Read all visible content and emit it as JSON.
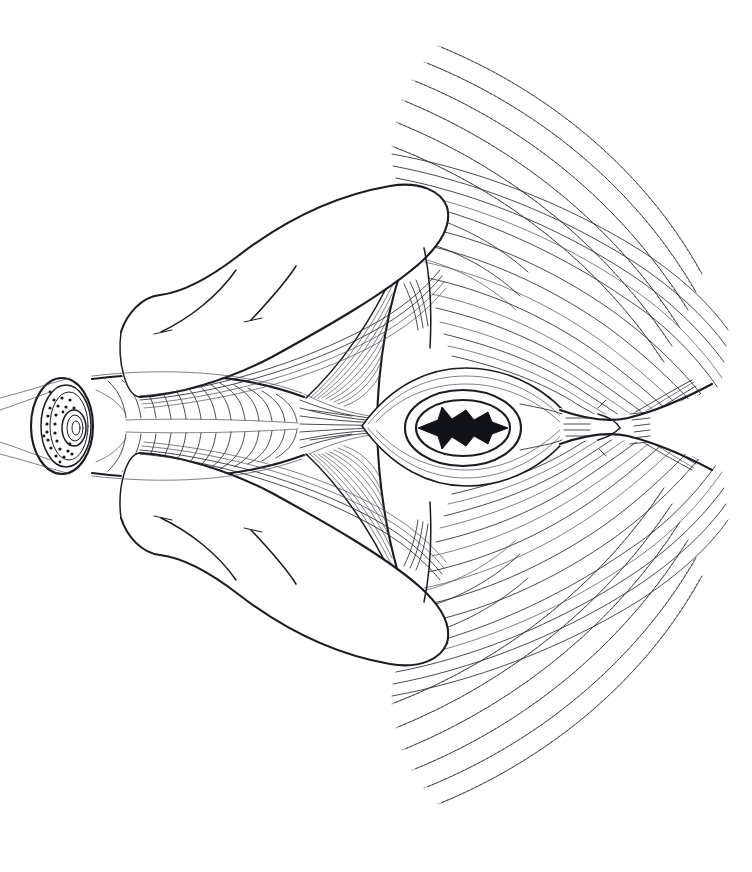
{
  "figure": {
    "domain": "anatomical-line-illustration",
    "title": "",
    "caption": "",
    "canvas": {
      "width": 752,
      "height": 872,
      "background": "#ffffff"
    },
    "style": {
      "ink_color": "#1b1b22",
      "fiber_color": "#2a2a31",
      "faint_fiber_color": "#4a4a55",
      "solid_fill": "#111118",
      "line_art": "monochrome pen-and-ink hatching"
    },
    "orientation": "horizontal midline axis at y=425; drawing is bilaterally symmetric about it",
    "labels": [],
    "annotations": [],
    "structures": [
      {
        "name": "tubular-organ-cross-section",
        "description": "cut end of a cylindrical tube at far left showing concentric wall layers, a stippled glandular zone and a small central lumen",
        "center": [
          62,
          425
        ],
        "radius_x": 30,
        "radius_y": 48,
        "layers": 3,
        "stipple_dots": 26,
        "lumen": {
          "center": [
            70,
            428
          ],
          "rings": 3
        }
      },
      {
        "name": "tubular-organ-body",
        "description": "longitudinal barrel of the tube running right from the cut face, covered in transverse circular-muscle hatching",
        "x_range": [
          60,
          300
        ],
        "y_range": [
          378,
          472
        ],
        "hatch_count": 34
      },
      {
        "name": "longitudinal-muscle-bands",
        "description": "narrow converging band of long fibers leaving the tube and running to the central orifice",
        "x_range": [
          296,
          398
        ],
        "fiber_count": 9
      },
      {
        "name": "central-orifice",
        "description": "oval orifice with a puckered star-shaped solid black slit at its centre, ringed by two concentric oval outlines",
        "center": [
          463,
          428
        ],
        "outer_oval": {
          "rx": 58,
          "ry": 38
        },
        "inner_oval": {
          "rx": 48,
          "ry": 30
        },
        "slit_rays": 6
      },
      {
        "name": "orifice-radiating-ellipse",
        "description": "lens/ellipse-shaped sheet of fibers surrounding the orifice, pointed at both ends",
        "x_range": [
          360,
          575
        ],
        "y_range": [
          368,
          488
        ]
      },
      {
        "name": "right-raphe-constriction",
        "description": "narrow waisted tendon/raphe right of the orifice where fibers pinch together, then flare again",
        "x_range": [
          560,
          700
        ],
        "y_range": [
          405,
          448
        ],
        "short_hatches": 12
      },
      {
        "name": "upper-limb-fold",
        "description": "upper smooth skin/limb fold sweeping from left of centre up to the right, drawn with a heavy contour and two short crease lines",
        "x_range": [
          118,
          455
        ],
        "y_range": [
          185,
          395
        ]
      },
      {
        "name": "lower-limb-fold",
        "description": "mirror-image lower smooth skin/limb fold sweeping from left of centre down to the right",
        "x_range": [
          118,
          455
        ],
        "y_range": [
          455,
          665
        ]
      },
      {
        "name": "upper-triangular-aponeurosis",
        "description": "upper triangular sheet between the tube and the fan, with fine oblique fibers converging to its apex",
        "apex": [
          310,
          400
        ],
        "fiber_count": 10
      },
      {
        "name": "lower-triangular-aponeurosis",
        "description": "lower triangular sheet, mirror of the upper one",
        "apex": [
          310,
          452
        ],
        "fiber_count": 10
      },
      {
        "name": "upper-muscle-fan",
        "description": "broad upper fan of long curved muscle fibers radiating from the central region outward to the upper right",
        "fiber_count": 26,
        "arc_origin": [
          470,
          428
        ],
        "span_degrees": [
          188,
          302
        ]
      },
      {
        "name": "lower-muscle-fan",
        "description": "broad lower fan of long curved muscle fibers radiating from the central region outward to the lower right, mirror of the upper fan",
        "fiber_count": 26,
        "arc_origin": [
          470,
          428
        ],
        "span_degrees": [
          58,
          172
        ]
      },
      {
        "name": "outer-fan-dotted-fibers",
        "description": "outermost fan fibers drawn as broken dotted arcs, fading at the periphery",
        "fiber_count": 14
      },
      {
        "name": "fan-boundary-arc",
        "description": "heavy curved arc marking the inner border of the fan, convex to the left, passing above and below the orifice ellipse",
        "top": [
          417,
          220
        ],
        "bottom": [
          417,
          636
        ]
      }
    ]
  }
}
